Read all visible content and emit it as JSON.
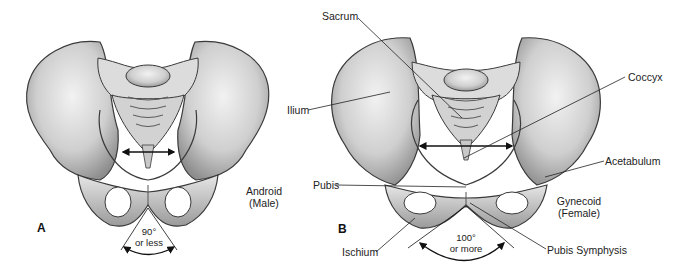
{
  "panels": [
    {
      "letter": "A",
      "type_label_line1": "Android",
      "type_label_line2": "(Male)",
      "angle_line1": "90°",
      "angle_line2": "or less"
    },
    {
      "letter": "B",
      "type_label_line1": "Gynecoid",
      "type_label_line2": "(Female)",
      "angle_line1": "100°",
      "angle_line2": "or more"
    }
  ],
  "anatomy_labels": {
    "sacrum": "Sacrum",
    "coccyx": "Coccyx",
    "ilium": "Ilium",
    "acetabulum": "Acetabulum",
    "pubis": "Pubis",
    "ischium": "Ischium",
    "pubis_symphysis": "Pubis Symphysis"
  },
  "colors": {
    "bone_light": "#e8e8e8",
    "bone_mid": "#b8b8b8",
    "bone_dark": "#7a7a7a",
    "outline": "#3a3a3a",
    "text": "#222222"
  }
}
